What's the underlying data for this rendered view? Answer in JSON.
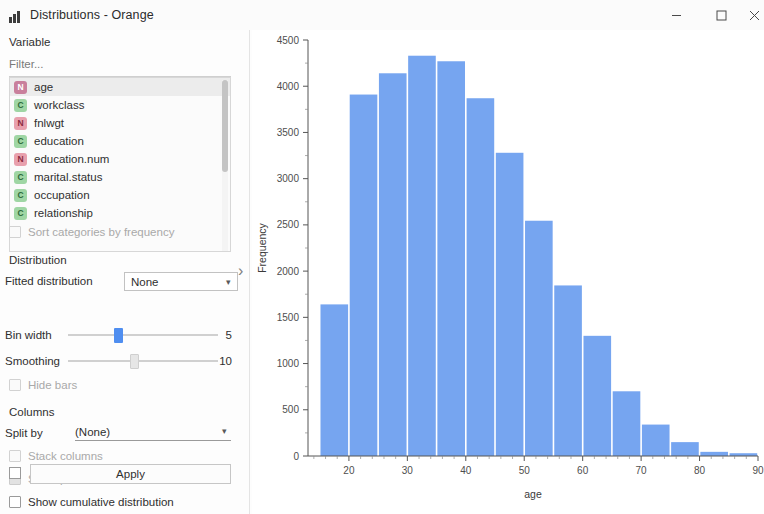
{
  "window": {
    "title": "Distributions - Orange",
    "icon": "bar-chart-icon",
    "controls": {
      "minimize": "minimize-icon",
      "maximize": "maximize-icon",
      "close": "close-icon"
    }
  },
  "panel": {
    "variable_group": "Variable",
    "filter_placeholder": "Filter...",
    "variables": [
      {
        "label": "age",
        "kind": "N",
        "selected": true
      },
      {
        "label": "workclass",
        "kind": "C",
        "selected": false
      },
      {
        "label": "fnlwgt",
        "kind": "N",
        "selected": false
      },
      {
        "label": "education",
        "kind": "C",
        "selected": false
      },
      {
        "label": "education.num",
        "kind": "N",
        "selected": false
      },
      {
        "label": "marital.status",
        "kind": "C",
        "selected": false
      },
      {
        "label": "occupation",
        "kind": "C",
        "selected": false
      },
      {
        "label": "relationship",
        "kind": "C",
        "selected": false
      }
    ],
    "sort_categories_label": "Sort categories by frequency",
    "distribution_group": "Distribution",
    "fitted_distribution_label": "Fitted distribution",
    "fitted_distribution_value": "None",
    "bin_width_label": "Bin width",
    "bin_width_value": "5",
    "smoothing_label": "Smoothing",
    "smoothing_value": "10",
    "hide_bars_label": "Hide bars",
    "columns_group": "Columns",
    "split_by_label": "Split by",
    "split_by_value": "(None)",
    "stack_columns_label": "Stack columns",
    "show_probabilities_label": "Show probabilities",
    "show_cumulative_label": "Show cumulative distribution",
    "apply_label": "Apply",
    "collapse_arrow": "chevron-right-icon"
  },
  "colors": {
    "bar_fill": "#76a5f0",
    "bar_gap": "#ffffff",
    "axis": "#555555",
    "accent": "#4f8ef0"
  },
  "chart_data": {
    "type": "bar",
    "title": "",
    "xlabel": "age",
    "ylabel": "Frequency",
    "xlim": [
      13,
      90
    ],
    "ylim": [
      0,
      4500
    ],
    "xticks": [
      20,
      30,
      40,
      50,
      60,
      70,
      80,
      90
    ],
    "yticks": [
      0,
      500,
      1000,
      1500,
      2000,
      2500,
      3000,
      3500,
      4000,
      4500
    ],
    "grid": false,
    "legend": "none",
    "bin_width": 5,
    "bin_starts": [
      15,
      20,
      25,
      30,
      35,
      40,
      45,
      50,
      55,
      60,
      65,
      70,
      75,
      80,
      85
    ],
    "categories": [
      "15-20",
      "20-25",
      "25-30",
      "30-35",
      "35-40",
      "40-45",
      "45-50",
      "50-55",
      "55-60",
      "60-65",
      "65-70",
      "70-75",
      "75-80",
      "80-85",
      "85-90"
    ],
    "values": [
      1640,
      3910,
      4140,
      4330,
      4270,
      3870,
      3280,
      2545,
      1845,
      1300,
      700,
      340,
      150,
      45,
      30
    ]
  }
}
